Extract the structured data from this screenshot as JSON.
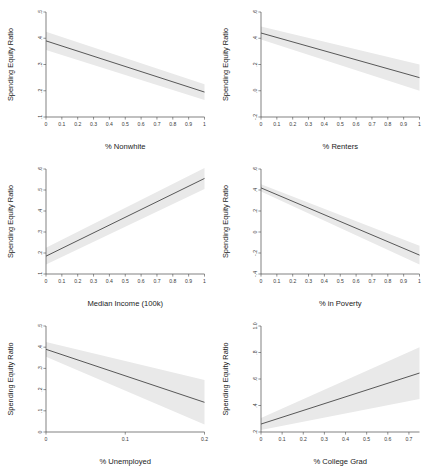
{
  "figure": {
    "type": "multi-panel-regression-plot",
    "panel_count": 6,
    "shared_ylabel": "Spending Equity Ratio",
    "line_color": "#4f4f4f",
    "band_color": "#e9e9e9"
  },
  "chart_data": [
    {
      "type": "line",
      "title": "",
      "xlabel": "% Nonwhite",
      "ylabel": "Spending Equity Ratio",
      "xlim": [
        0,
        1
      ],
      "ylim": [
        0.1,
        0.5
      ],
      "xticks": [
        "0",
        "0.1",
        "0.2",
        "0.3",
        "0.4",
        "0.5",
        "0.6",
        "0.7",
        "0.8",
        "0.9",
        "1"
      ],
      "xtick_values": [
        0,
        0.1,
        0.2,
        0.3,
        0.4,
        0.5,
        0.6,
        0.7,
        0.8,
        0.9,
        1
      ],
      "yticks": [
        ".5",
        ".4",
        ".3",
        ".2",
        ".1"
      ],
      "ytick_values": [
        0.5,
        0.4,
        0.3,
        0.2,
        0.1
      ],
      "grid": false,
      "legend": "none",
      "x": [
        0,
        1
      ],
      "fit": [
        0.39,
        0.195
      ],
      "ci_upper": [
        0.425,
        0.225
      ],
      "ci_lower": [
        0.355,
        0.165
      ]
    },
    {
      "type": "line",
      "title": "",
      "xlabel": "% Renters",
      "ylabel": "Spending Equity Ratio",
      "xlim": [
        0,
        1
      ],
      "ylim": [
        -0.2,
        0.6
      ],
      "xticks": [
        "0",
        "0.1",
        "0.2",
        "0.3",
        "0.4",
        "0.5",
        "0.6",
        "0.7",
        "0.8",
        "0.9",
        "1"
      ],
      "xtick_values": [
        0,
        0.1,
        0.2,
        0.3,
        0.4,
        0.5,
        0.6,
        0.7,
        0.8,
        0.9,
        1
      ],
      "yticks": [
        ".6",
        ".4",
        ".2",
        ".0",
        "-.2"
      ],
      "ytick_values": [
        0.6,
        0.4,
        0.2,
        0.0,
        -0.2
      ],
      "grid": false,
      "legend": "none",
      "x": [
        0,
        1
      ],
      "fit": [
        0.44,
        0.1
      ],
      "ci_upper": [
        0.49,
        0.2
      ],
      "ci_lower": [
        0.39,
        0.0
      ]
    },
    {
      "type": "line",
      "title": "",
      "xlabel": "Median Income (100k)",
      "ylabel": "Spending Equity Ratio",
      "xlim": [
        0,
        1
      ],
      "ylim": [
        0.1,
        0.6
      ],
      "xticks": [
        "0",
        "0.1",
        "0.2",
        "0.3",
        "0.4",
        "0.5",
        "0.6",
        "0.7",
        "0.8",
        "0.9",
        "1"
      ],
      "xtick_values": [
        0,
        0.1,
        0.2,
        0.3,
        0.4,
        0.5,
        0.6,
        0.7,
        0.8,
        0.9,
        1
      ],
      "yticks": [
        ".6",
        ".5",
        ".4",
        ".3",
        ".2",
        ".1"
      ],
      "ytick_values": [
        0.6,
        0.5,
        0.4,
        0.3,
        0.2,
        0.1
      ],
      "grid": false,
      "legend": "none",
      "x": [
        0,
        1
      ],
      "fit": [
        0.185,
        0.555
      ],
      "ci_upper": [
        0.225,
        0.605
      ],
      "ci_lower": [
        0.145,
        0.505
      ]
    },
    {
      "type": "line",
      "title": "",
      "xlabel": "% in Poverty",
      "ylabel": "Spending Equity Ratio",
      "xlim": [
        0,
        1
      ],
      "ylim": [
        -0.4,
        0.6
      ],
      "xticks": [
        "0",
        "0.1",
        "0.2",
        "0.3",
        "0.4",
        "0.5",
        "0.6",
        "0.7",
        "0.8",
        "0.9",
        "1"
      ],
      "xtick_values": [
        0,
        0.1,
        0.2,
        0.3,
        0.4,
        0.5,
        0.6,
        0.7,
        0.8,
        0.9,
        1
      ],
      "yticks": [
        ".6",
        ".4",
        ".2",
        "0",
        "-.2",
        "-.4"
      ],
      "ytick_values": [
        0.6,
        0.4,
        0.2,
        0.0,
        -0.2,
        -0.4
      ],
      "grid": false,
      "legend": "none",
      "x": [
        0,
        1
      ],
      "fit": [
        0.42,
        -0.22
      ],
      "ci_upper": [
        0.455,
        -0.13
      ],
      "ci_lower": [
        0.385,
        -0.31
      ]
    },
    {
      "type": "line",
      "title": "",
      "xlabel": "% Unemployed",
      "ylabel": "Spending Equity Ratio",
      "xlim": [
        0,
        0.2
      ],
      "ylim": [
        0,
        0.5
      ],
      "xticks": [
        "0",
        "0.1",
        "0.2"
      ],
      "xtick_values": [
        0,
        0.1,
        0.2
      ],
      "yticks": [
        ".5",
        ".4",
        ".3",
        ".2",
        ".1",
        "0"
      ],
      "ytick_values": [
        0.5,
        0.4,
        0.3,
        0.2,
        0.1,
        0.0
      ],
      "grid": false,
      "legend": "none",
      "x": [
        0,
        0.2
      ],
      "fit": [
        0.39,
        0.14
      ],
      "ci_upper": [
        0.425,
        0.245
      ],
      "ci_lower": [
        0.355,
        0.035
      ]
    },
    {
      "type": "line",
      "title": "",
      "xlabel": "% College Grad",
      "ylabel": "Spending Equity Ratio",
      "xlim": [
        0,
        0.75
      ],
      "ylim": [
        0.2,
        1.0
      ],
      "xticks": [
        "0",
        "0.1",
        "0.2",
        "0.3",
        "0.4",
        "0.5",
        "0.6",
        "0.7"
      ],
      "xtick_values": [
        0,
        0.1,
        0.2,
        0.3,
        0.4,
        0.5,
        0.6,
        0.7
      ],
      "yticks": [
        "1.0",
        ".8",
        ".6",
        ".4",
        ".2"
      ],
      "ytick_values": [
        1.0,
        0.8,
        0.6,
        0.4,
        0.2
      ],
      "grid": false,
      "legend": "none",
      "x": [
        0,
        0.75
      ],
      "fit": [
        0.26,
        0.645
      ],
      "ci_upper": [
        0.305,
        0.84
      ],
      "ci_lower": [
        0.215,
        0.45
      ]
    }
  ]
}
